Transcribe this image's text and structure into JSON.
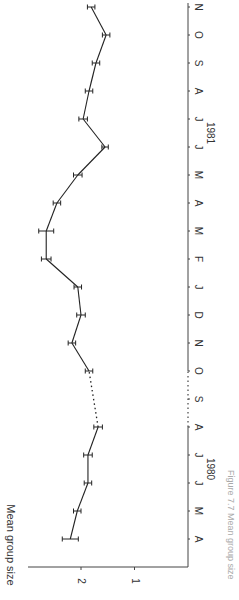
{
  "chart_data": {
    "type": "line",
    "orientation": "rotated-90-clockwise",
    "title": "",
    "caption": "Figure 7.7 Mean group size",
    "ylabel": "Mean group size",
    "xlabel": "",
    "yticks": [
      1,
      2
    ],
    "ylim": [
      0,
      2.9
    ],
    "grid": false,
    "legend": null,
    "year_labels": [
      {
        "label": "1980",
        "between": [
          "M",
          "J"
        ],
        "month_index": 2.5
      },
      {
        "label": "1981",
        "between": [
          "M",
          "J"
        ],
        "month_index": 14.5
      }
    ],
    "categories": [
      "A",
      "M",
      "J",
      "J",
      "A",
      "S",
      "O",
      "N",
      "D",
      "J",
      "F",
      "M",
      "A",
      "M",
      "J",
      "J",
      "A",
      "S",
      "O",
      "N"
    ],
    "series": [
      {
        "name": "Mean group size",
        "values": [
          2.2,
          2.07,
          1.87,
          1.87,
          1.68,
          null,
          1.85,
          2.17,
          2.0,
          2.06,
          2.65,
          2.65,
          2.45,
          2.06,
          1.55,
          1.96,
          1.85,
          1.72,
          1.53,
          1.81
        ],
        "error": [
          0.15,
          0.07,
          0.07,
          0.08,
          0.08,
          null,
          0.07,
          0.07,
          0.08,
          0.07,
          0.09,
          0.14,
          0.07,
          0.08,
          0.06,
          0.08,
          0.07,
          0.07,
          0.07,
          0.07
        ],
        "gap": {
          "from_index": 4,
          "to_index": 6,
          "style": "dotted",
          "note": "no data in September 1980"
        }
      }
    ]
  }
}
